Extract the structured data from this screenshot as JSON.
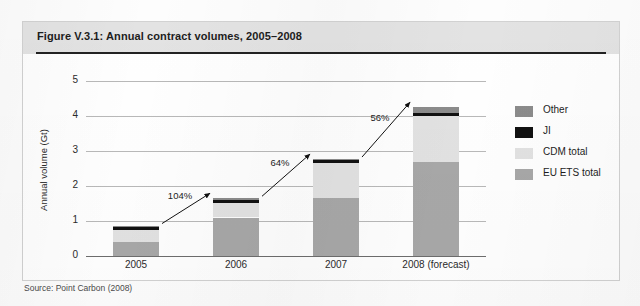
{
  "figure": {
    "title": "Figure V.3.1: Annual contract volumes, 2005–2008",
    "source": "Source: Point Carbon (2008)"
  },
  "legend": {
    "position": "right",
    "items": [
      {
        "label": "Other",
        "color": "#8c8c8c"
      },
      {
        "label": "JI",
        "color": "#111111"
      },
      {
        "label": "CDM total",
        "color": "#e2e2e2"
      },
      {
        "label": "EU ETS total",
        "color": "#a8a8a8"
      }
    ]
  },
  "chart_data": {
    "type": "bar",
    "stacked": true,
    "title": "Figure V.3.1: Annual contract volumes, 2005–2008",
    "xlabel": "",
    "ylabel": "Annual volume (Gt)",
    "ylim": [
      0,
      5
    ],
    "yticks": [
      0,
      1,
      2,
      3,
      4,
      5
    ],
    "grid": true,
    "categories": [
      "2005",
      "2006",
      "2007",
      "2008 (forecast)"
    ],
    "series": [
      {
        "name": "EU ETS total",
        "color": "#a8a8a8",
        "values": [
          0.4,
          1.1,
          1.65,
          2.7
        ]
      },
      {
        "name": "CDM total",
        "color": "#e2e2e2",
        "values": [
          0.35,
          0.42,
          1.0,
          1.3
        ]
      },
      {
        "name": "JI",
        "color": "#111111",
        "values": [
          0.07,
          0.07,
          0.08,
          0.09
        ]
      },
      {
        "name": "Other",
        "color": "#8c8c8c",
        "values": [
          0.05,
          0.06,
          0.04,
          0.16
        ]
      }
    ],
    "totals": [
      0.87,
      1.65,
      2.77,
      4.25
    ],
    "annotations": [
      {
        "label": "104%",
        "from": "2005",
        "to": "2006"
      },
      {
        "label": "64%",
        "from": "2006",
        "to": "2007"
      },
      {
        "label": "56%",
        "from": "2007",
        "to": "2008 (forecast)"
      }
    ]
  }
}
